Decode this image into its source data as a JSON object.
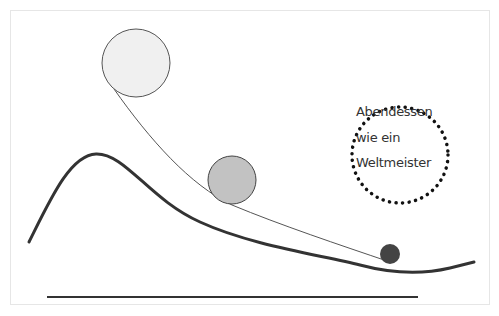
{
  "diagram": {
    "label_lines": [
      "Abendessen",
      "wie ein",
      "Weltmeister"
    ],
    "colors": {
      "curve": "#333333",
      "thin_line": "#555555",
      "circle_large": "#f0f0f0",
      "circle_medium": "#c2c2c2",
      "circle_small": "#444444",
      "dots": "#111111",
      "frame": "#e6e6e6"
    },
    "elements": [
      {
        "type": "circle",
        "name": "large-ball",
        "cx": 136,
        "cy": 63,
        "r": 34
      },
      {
        "type": "circle",
        "name": "medium-ball",
        "cx": 232,
        "cy": 180,
        "r": 24
      },
      {
        "type": "circle",
        "name": "small-ball",
        "cx": 390,
        "cy": 254,
        "r": 10
      },
      {
        "type": "dotted-circle",
        "name": "label-circle",
        "cx": 400,
        "cy": 155,
        "r": 48
      }
    ]
  }
}
